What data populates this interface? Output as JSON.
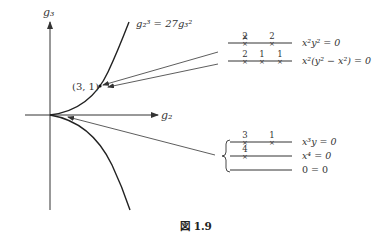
{
  "figure": {
    "caption": "図 1.9",
    "axes": {
      "x_label": "g₂",
      "y_label": "g₃"
    },
    "curve_label": "g₂³ = 27g₃²",
    "point_label": "(3, 1)",
    "upper_group": [
      {
        "marks": [
          "2",
          "2"
        ],
        "equation": "x²y² = 0"
      },
      {
        "marks": [
          "2",
          "1",
          "1"
        ],
        "equation": "x²(y² − x²) = 0"
      }
    ],
    "lower_group": [
      {
        "marks": [
          "3",
          "1"
        ],
        "equation": "x³y = 0"
      },
      {
        "marks": [
          "4"
        ],
        "equation": "x⁴ = 0"
      },
      {
        "marks": [],
        "equation": "0 = 0"
      }
    ]
  }
}
